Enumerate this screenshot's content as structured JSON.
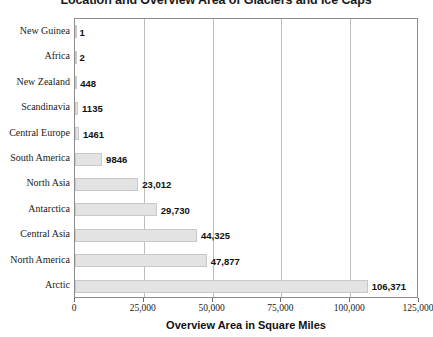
{
  "chart_data": {
    "type": "bar",
    "orientation": "horizontal",
    "title": "Location and Overview Area of Glaciers and Ice Caps",
    "xlabel": "Overview Area in Square Miles",
    "ylabel": "",
    "xlim": [
      0,
      125000
    ],
    "xticks": [
      0,
      25000,
      50000,
      75000,
      100000,
      125000
    ],
    "xticklabels": [
      "0",
      "25,000",
      "50,000",
      "75,000",
      "100,000",
      "125,000"
    ],
    "grid": true,
    "grid_axis": "x",
    "legend": false,
    "bar_color": "#e3e3e3",
    "bar_border_color": "#c9c9c9",
    "axis_color": "#8c8c8c",
    "gridline_color": "#bfbfbf",
    "categories": [
      "New Guinea",
      "Africa",
      "New Zealand",
      "Scandinavia",
      "Central Europe",
      "South America",
      "North Asia",
      "Antarctica",
      "Central Asia",
      "North America",
      "Arctic"
    ],
    "values": [
      1,
      2,
      448,
      1135,
      1461,
      9846,
      23012,
      29730,
      44325,
      47877,
      106371
    ],
    "value_labels": [
      "1",
      "2",
      "448",
      "1135",
      "1461",
      "9846",
      "23,012",
      "29,730",
      "44,325",
      "47,877",
      "106,371"
    ]
  }
}
